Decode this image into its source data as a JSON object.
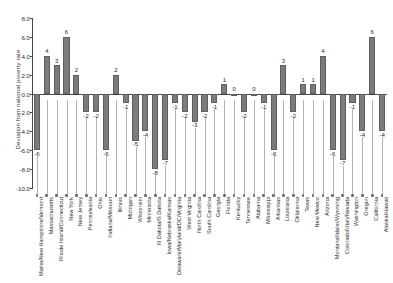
{
  "chart_data": {
    "type": "bar",
    "title": "",
    "subtitle": "",
    "xlabel": "",
    "ylabel": "Deviation from national poverty rate",
    "ylim": [
      -10.0,
      8.0
    ],
    "ytick_labels": [
      "8.0",
      "6.0",
      "4.0",
      "2.0",
      "0.0",
      "-2.0",
      "-4.0",
      "-6.0",
      "-8.0",
      "-10.0"
    ],
    "ytick_values": [
      8,
      6,
      4,
      2,
      0,
      -2,
      -4,
      -6,
      -8,
      -10
    ],
    "grid": false,
    "legend": "none",
    "bar_color": "#7b7b7b",
    "axis_color": "#4a4a4a",
    "categories": [
      "Maine/New Hampshire/Vermont",
      "Massachusetts",
      "Rhode Island/Connecticut",
      "New York",
      "New Jersey",
      "Pennsylvania",
      "Ohio",
      "Indiana/Missouri",
      "Illinois",
      "Michigan",
      "Wisconsin",
      "Minnesota",
      "N Dakota/S Dakota",
      "Iowa/Nebraska/Kansas",
      "Delaware/Maryland/DC/Virginia",
      "West Virginia",
      "North Carolina",
      "South Carolina",
      "Georgia",
      "Florida",
      "Kentucky",
      "Tennessee",
      "Alabama",
      "Mississippi",
      "Arkansas",
      "Louisiana",
      "Oklahoma",
      "Texas",
      "New Mexico",
      "Arizona",
      "Montana/Idaho/Wyoming",
      "Colorado/Utah/Nevada",
      "Washington",
      "Oregon",
      "California",
      "Alaska/Hawaii"
    ],
    "values": [
      -6,
      4,
      3,
      6,
      2,
      -2,
      -2,
      -6,
      2,
      -1,
      -5,
      -4,
      -8,
      -7,
      -1,
      -2,
      -3,
      -2,
      -1,
      1,
      0,
      -2,
      0,
      -1,
      -6,
      3,
      -2,
      1,
      1,
      4,
      -6,
      -7,
      -1,
      -4,
      6,
      -4
    ],
    "value_labels": [
      "-6",
      "4",
      "3",
      "6",
      "2",
      "-2",
      "-2",
      "-6",
      "2",
      "-1",
      "-5",
      "-4",
      "-8",
      "-7",
      "-1",
      "-2",
      "-3",
      "-2",
      "-1",
      "1",
      "0",
      "-2",
      "0",
      "-1",
      "-6",
      "3",
      "-2",
      "1",
      "1",
      "4",
      "-6",
      "-7",
      "-1",
      "-4",
      "6",
      "-4"
    ]
  }
}
